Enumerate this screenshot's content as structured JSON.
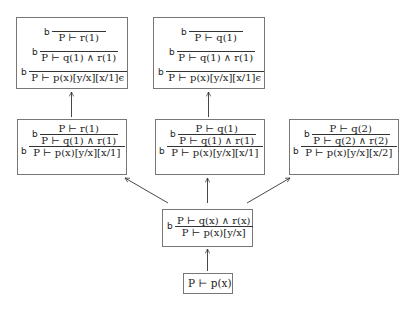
{
  "diagram": {
    "nodes": [
      {
        "id": "top-left",
        "rules": [
          {
            "label": "b",
            "premise": "",
            "conclusion": "P ⊢ r(1)"
          },
          {
            "label": "b",
            "premise": "",
            "conclusion": "P ⊢ q(1) ∧ r(1)"
          },
          {
            "label": "b",
            "premise": "",
            "conclusion": "P ⊢ p(x)[y/x][x/1]ϵ"
          }
        ]
      },
      {
        "id": "top-middle",
        "rules": [
          {
            "label": "b",
            "premise": "",
            "conclusion": "P ⊢ q(1)"
          },
          {
            "label": "b",
            "premise": "",
            "conclusion": "P ⊢ q(1) ∧ r(1)"
          },
          {
            "label": "b",
            "premise": "",
            "conclusion": "P ⊢ p(x)[y/x][x/1]ϵ"
          }
        ]
      },
      {
        "id": "mid-left",
        "lines": [
          {
            "label": "",
            "text": "P ⊢ r(1)"
          },
          {
            "label": "b",
            "text": "P ⊢ q(1) ∧ r(1)"
          },
          {
            "label": "b",
            "text": "P ⊢ p(x)[y/x][x/1]"
          }
        ]
      },
      {
        "id": "mid-middle",
        "lines": [
          {
            "label": "",
            "text": "P ⊢ q(1)"
          },
          {
            "label": "b",
            "text": "P ⊢ q(1) ∧ r(1)"
          },
          {
            "label": "b",
            "text": "P ⊢ p(x)[y/x][x/1]"
          }
        ]
      },
      {
        "id": "mid-right",
        "lines": [
          {
            "label": "",
            "text": "P ⊢ q(2)"
          },
          {
            "label": "b",
            "text": "P ⊢ q(2) ∧ r(2)"
          },
          {
            "label": "b",
            "text": "P ⊢ p(x)[y/x][x/2]"
          }
        ]
      },
      {
        "id": "lower-middle",
        "lines": [
          {
            "label": "",
            "text": "P ⊢ q(x) ∧ r(x)"
          },
          {
            "label": "b",
            "text": "P ⊢ p(x)[y/x]"
          }
        ]
      },
      {
        "id": "root",
        "text": "P ⊢ p(x)"
      }
    ],
    "edges": [
      {
        "from": "root",
        "to": "lower-middle"
      },
      {
        "from": "lower-middle",
        "to": "mid-left"
      },
      {
        "from": "lower-middle",
        "to": "mid-middle"
      },
      {
        "from": "lower-middle",
        "to": "mid-right"
      },
      {
        "from": "mid-left",
        "to": "top-left"
      },
      {
        "from": "mid-middle",
        "to": "top-middle"
      }
    ]
  }
}
